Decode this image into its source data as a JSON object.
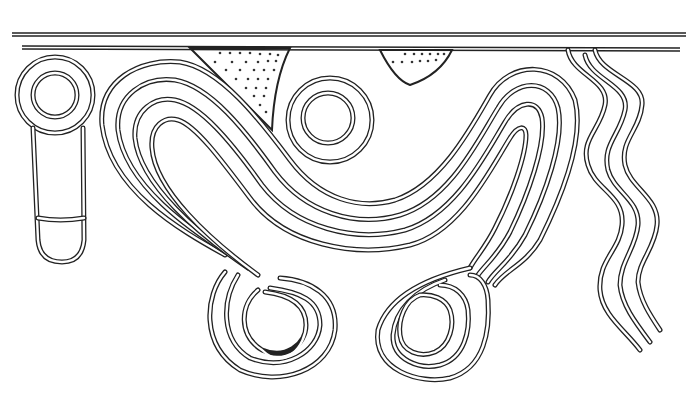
{
  "canvas": {
    "width": 690,
    "height": 395,
    "background": "#ffffff",
    "ink": "#222222"
  },
  "figure": {
    "elements": [
      "double border lines at top",
      "dotted triangle left",
      "dotted triangle right",
      "ringed circle with stem on left",
      "central concentric ring",
      "U-shaped nested band of curves",
      "left spiral loop",
      "right spiral loop",
      "three wavy parallel lines on right"
    ]
  }
}
